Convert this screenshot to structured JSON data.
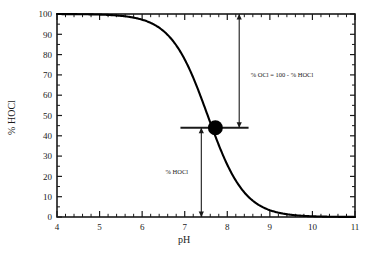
{
  "chart_data": {
    "type": "line",
    "title": "",
    "xlabel": "pH",
    "ylabel": "% HOCl",
    "xlim": [
      4,
      11
    ],
    "ylim": [
      0,
      100
    ],
    "grid": false,
    "legend": "none",
    "x_ticks": [
      "4",
      "5",
      "6",
      "7",
      "8",
      "9",
      "10",
      "11"
    ],
    "x_tick_values": [
      4,
      5,
      6,
      7,
      8,
      9,
      10,
      11
    ],
    "x_minor_per_major": 5,
    "y_ticks": [
      "0",
      "10",
      "20",
      "30",
      "40",
      "50",
      "60",
      "70",
      "80",
      "90",
      "100"
    ],
    "y_tick_values": [
      0,
      10,
      20,
      30,
      40,
      50,
      60,
      70,
      80,
      90,
      100
    ],
    "y_minor_per_major": 2,
    "series": [
      {
        "name": "% HOCl",
        "pKa": 7.54,
        "x": [
          4.0,
          4.5,
          5.0,
          5.2,
          5.4,
          5.6,
          5.8,
          6.0,
          6.2,
          6.4,
          6.6,
          6.8,
          7.0,
          7.2,
          7.4,
          7.54,
          7.7,
          7.9,
          8.1,
          8.3,
          8.5,
          8.7,
          8.9,
          9.1,
          9.3,
          9.5,
          9.8,
          10.1,
          10.5,
          11.0
        ],
        "values": [
          100.0,
          99.9,
          99.7,
          99.5,
          99.3,
          98.8,
          98.2,
          97.2,
          95.6,
          93.3,
          89.7,
          84.6,
          77.7,
          68.6,
          58.0,
          50.0,
          41.1,
          31.6,
          23.2,
          15.9,
          10.4,
          6.5,
          4.2,
          2.7,
          1.7,
          1.1,
          0.5,
          0.3,
          0.1,
          0.0
        ]
      }
    ],
    "markers": [
      {
        "name": "equivalence-point",
        "x": 7.72,
        "y": 44.0,
        "shape": "filled-circle",
        "radius_px": 7.5
      }
    ],
    "guide_lines": [
      {
        "name": "horizontal-guide",
        "orientation": "horizontal",
        "y": 44.0,
        "x_start": 6.9,
        "x_end": 8.5
      }
    ],
    "annotations": [
      {
        "name": "ocl-annotation",
        "text": "% OCl = 100 - % HOCl",
        "x": 8.55,
        "y": 69.0,
        "arrow": {
          "name": "ocl-arrow",
          "orientation": "vertical",
          "x": 8.28,
          "y_start": 100.0,
          "y_end": 44.0,
          "double_headed": true
        }
      },
      {
        "name": "hocl-annotation",
        "text": "% HOCl",
        "x": 6.55,
        "y": 21.0,
        "arrow": {
          "name": "hocl-arrow",
          "orientation": "vertical",
          "x": 7.39,
          "y_start": 44.0,
          "y_end": 0.0,
          "double_headed": true
        }
      }
    ],
    "colors": {
      "curve": "#000000",
      "marker": "#000000",
      "axis": "#1a1a1a",
      "annotation": "#1a1a1a",
      "background": "#ffffff"
    }
  }
}
